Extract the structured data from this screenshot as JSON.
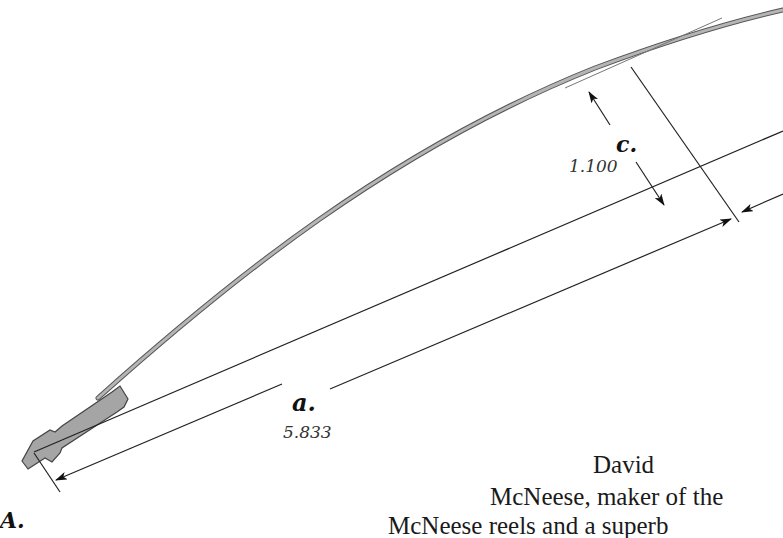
{
  "diagram": {
    "labels": {
      "point_a": "A.",
      "dim_a_letter": "a.",
      "dim_a_value": "5.833",
      "dim_c_letter": "c.",
      "dim_c_value": "1.100"
    },
    "colors": {
      "rod_fill": "#a9a9a9",
      "rod_outline": "#555555",
      "lines": "#222222"
    }
  },
  "caption": {
    "lines": [
      "David",
      "McNeese, maker of the",
      "McNeese reels and a superb"
    ]
  }
}
